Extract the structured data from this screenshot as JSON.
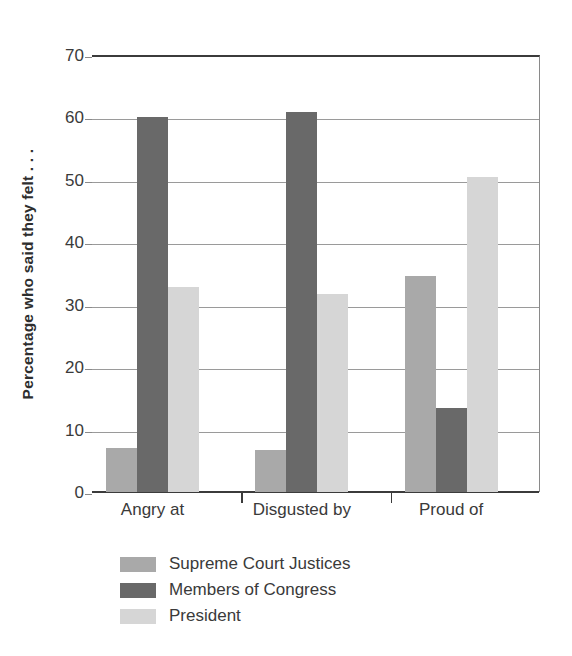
{
  "chart_data": {
    "type": "bar",
    "title": "",
    "xlabel": "",
    "ylabel": "Percentage who said they felt . . .",
    "ylim": [
      0,
      70
    ],
    "ytick_step": 10,
    "yticks": [
      0,
      10,
      20,
      30,
      40,
      50,
      60,
      70
    ],
    "ytick_labels": [
      "0",
      "10",
      "20",
      "30",
      "40",
      "50",
      "60",
      "70"
    ],
    "grid": "horizontal",
    "legend_position": "below-left",
    "categories": [
      "Angry at",
      "Disgusted by",
      "Proud of"
    ],
    "series": [
      {
        "name": "Supreme Court Justices",
        "color": "#a9a9a9",
        "values": [
          7.0,
          6.8,
          34.6
        ]
      },
      {
        "name": "Members of Congress",
        "color": "#696969",
        "values": [
          60.0,
          60.9,
          13.5
        ]
      },
      {
        "name": "President",
        "color": "#d6d6d6",
        "values": [
          32.9,
          31.7,
          50.5
        ]
      }
    ]
  },
  "colors": {
    "axis": "#3b3b3b",
    "gridline": "#9a9a9a",
    "text": "#3a3a3a",
    "background": "#ffffff"
  }
}
